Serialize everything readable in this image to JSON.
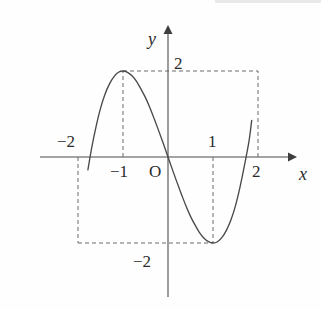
{
  "chart_data": {
    "type": "line",
    "title": "",
    "subtitle": "",
    "xlabel": "x",
    "ylabel": "y",
    "xlim": [
      -2.25,
      2.9
    ],
    "ylim": [
      -2.95,
      2.95
    ],
    "grid": false,
    "legend": null,
    "function": "y = x^3 - 3x",
    "x_ticks": [
      -2,
      -1,
      1,
      2
    ],
    "x_tick_labels": [
      "−2",
      "−1",
      "1",
      "2"
    ],
    "y_ticks": [
      -2,
      2
    ],
    "y_tick_labels": [
      "−2",
      "2"
    ],
    "origin_label": "O",
    "annotations": [
      {
        "name": "local-maximum",
        "x": -1,
        "y": 2
      },
      {
        "name": "local-minimum",
        "x": 1,
        "y": -2
      },
      {
        "name": "point-left",
        "x": -2,
        "y": -2
      },
      {
        "name": "point-right",
        "x": 2,
        "y": 2
      }
    ],
    "dashed_guides": [
      {
        "name": "guide-vertical-x-neg2",
        "from": [
          -2,
          0
        ],
        "to": [
          -2,
          -2
        ]
      },
      {
        "name": "guide-vertical-x-neg1",
        "from": [
          -1,
          0
        ],
        "to": [
          -1,
          2
        ]
      },
      {
        "name": "guide-vertical-x-pos1",
        "from": [
          1,
          0
        ],
        "to": [
          1,
          -2
        ]
      },
      {
        "name": "guide-vertical-x-pos2",
        "from": [
          2,
          0
        ],
        "to": [
          2,
          2
        ]
      },
      {
        "name": "guide-horizontal-y-2",
        "from": [
          -1,
          2
        ],
        "to": [
          2,
          2
        ]
      },
      {
        "name": "guide-horizontal-y-neg2",
        "from": [
          -2,
          -2
        ],
        "to": [
          1,
          -2
        ]
      }
    ],
    "series": [
      {
        "name": "cubic",
        "x": [
          -1.78,
          -1.7,
          -1.6,
          -1.5,
          -1.4,
          -1.3,
          -1.2,
          -1.1,
          -1.0,
          -0.9,
          -0.8,
          -0.7,
          -0.6,
          -0.5,
          -0.4,
          -0.3,
          -0.2,
          -0.1,
          0.0,
          0.1,
          0.2,
          0.3,
          0.4,
          0.5,
          0.6,
          0.7,
          0.8,
          0.9,
          1.0,
          1.1,
          1.2,
          1.3,
          1.4,
          1.5,
          1.6,
          1.7,
          1.8,
          1.86
        ],
        "y": [
          -0.3,
          0.19,
          0.7,
          1.13,
          1.46,
          1.7,
          1.87,
          1.97,
          2.0,
          1.97,
          1.89,
          1.76,
          1.58,
          1.38,
          1.14,
          0.87,
          0.59,
          0.3,
          0.0,
          -0.3,
          -0.59,
          -0.87,
          -1.14,
          -1.38,
          -1.58,
          -1.76,
          -1.89,
          -1.97,
          -2.0,
          -1.97,
          -1.87,
          -1.7,
          -1.46,
          -1.13,
          -0.7,
          -0.19,
          0.37,
          0.85
        ]
      }
    ]
  },
  "axes": {
    "x_axis_label": "x",
    "y_axis_label": "y",
    "origin": "O"
  },
  "labels": {
    "x_neg2": "−2",
    "x_neg1": "−1",
    "x_pos1": "1",
    "x_pos2": "2",
    "y_pos2": "2",
    "y_neg2": "−2"
  },
  "colors": {
    "curve": "#4a4a4a",
    "axis": "#4b4b4b",
    "guide": "#6a6a6a",
    "text": "#2b2b2b",
    "background": "#fefefe"
  }
}
